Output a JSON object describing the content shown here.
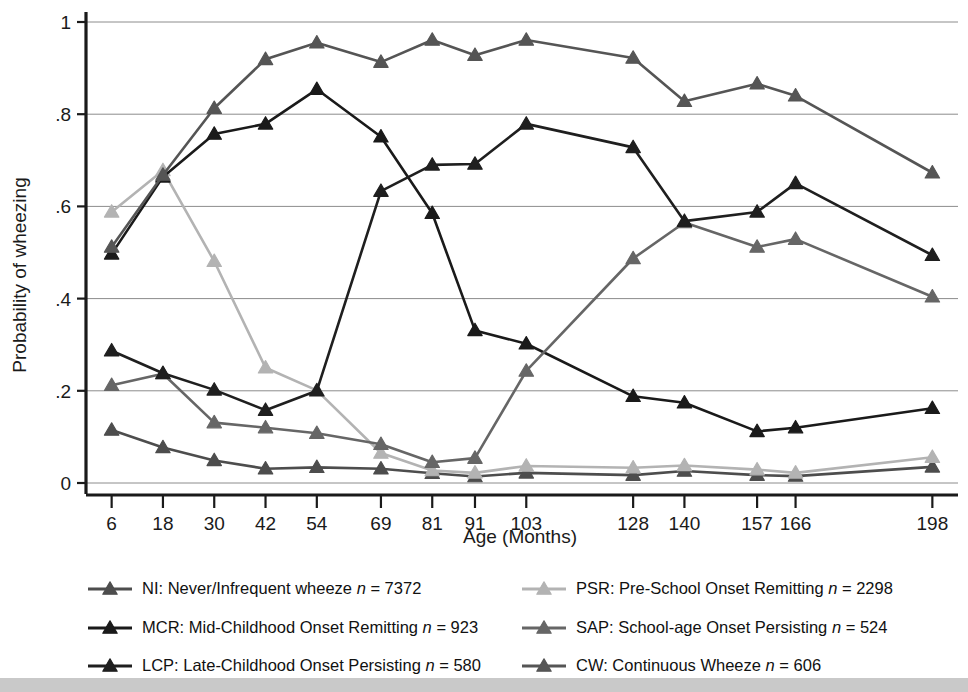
{
  "chart_data": {
    "type": "line",
    "title": "",
    "xlabel": "Age (Months)",
    "ylabel": "Probability of wheezing",
    "x": [
      6,
      18,
      30,
      42,
      54,
      69,
      81,
      91,
      103,
      128,
      140,
      157,
      166,
      198
    ],
    "xtick_labels": [
      "6",
      "18",
      "30",
      "42",
      "54",
      "69",
      "81",
      "91",
      "103",
      "128",
      "140",
      "157",
      "166",
      "198"
    ],
    "ytick_labels": [
      "0",
      ".2",
      ".4",
      ".6",
      ".8",
      "1"
    ],
    "ytick_values": [
      0,
      0.2,
      0.4,
      0.6,
      0.8,
      1
    ],
    "ylim": [
      0,
      1
    ],
    "xlim": [
      0,
      204
    ],
    "grid": "horizontal",
    "legend_position": "bottom",
    "series": [
      {
        "key": "NI",
        "name": "NI: Never/Infrequent wheeze",
        "n": "7372",
        "n_label": "n = 7372",
        "color": "#4d4d4d",
        "values": [
          0.115,
          0.077,
          0.049,
          0.031,
          0.034,
          0.031,
          0.021,
          0.014,
          0.022,
          0.017,
          0.026,
          0.017,
          0.015,
          0.035
        ]
      },
      {
        "key": "PSR",
        "name": "PSR: Pre-School Onset Remitting",
        "n": "2298",
        "n_label": "n = 2298",
        "color": "#b3b3b3",
        "values": [
          0.588,
          0.678,
          0.481,
          0.25,
          0.201,
          0.065,
          0.027,
          0.022,
          0.037,
          0.033,
          0.038,
          0.029,
          0.022,
          0.056
        ]
      },
      {
        "key": "MCR",
        "name": "MCR: Mid-Childhood Onset Remitting",
        "n": "923",
        "n_label": "n = 923",
        "color": "#1a1a1a",
        "values": [
          0.497,
          0.664,
          0.757,
          0.779,
          0.854,
          0.751,
          0.585,
          0.331,
          0.302,
          0.188,
          0.174,
          0.112,
          0.12,
          0.162
        ]
      },
      {
        "key": "SAP",
        "name": "SAP: School-age Onset Persisting",
        "n": "524",
        "n_label": "n = 524",
        "color": "#666666",
        "values": [
          0.212,
          0.237,
          0.131,
          0.12,
          0.108,
          0.084,
          0.045,
          0.054,
          0.243,
          0.487,
          0.565,
          0.512,
          0.529,
          0.404
        ]
      },
      {
        "key": "LCP",
        "name": "LCP: Late-Childhood Onset Persisting",
        "n": "580",
        "n_label": "n = 580",
        "color": "#1f1f1f",
        "values": [
          0.287,
          0.238,
          0.202,
          0.158,
          0.2,
          0.633,
          0.69,
          0.692,
          0.779,
          0.728,
          0.568,
          0.588,
          0.65,
          0.494
        ]
      },
      {
        "key": "CW",
        "name": "CW: Continuous Wheeze",
        "n": "606",
        "n_label": "n = 606",
        "color": "#555555",
        "values": [
          0.512,
          0.668,
          0.813,
          0.919,
          0.955,
          0.913,
          0.961,
          0.928,
          0.961,
          0.922,
          0.828,
          0.866,
          0.84,
          0.673
        ]
      }
    ]
  },
  "legend": {
    "rows": [
      [
        "NI",
        "PSR"
      ],
      [
        "MCR",
        "SAP"
      ],
      [
        "LCP",
        "CW"
      ]
    ]
  }
}
